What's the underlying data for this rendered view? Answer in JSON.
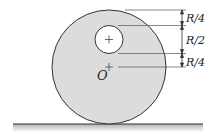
{
  "diagram": {
    "center_label": "O",
    "dimensions": [
      {
        "label": "R/4",
        "from": "top of disk",
        "to": "top of hole"
      },
      {
        "label": "R/2",
        "from": "top of hole",
        "to": "bottom of hole"
      },
      {
        "label": "R/4",
        "from": "bottom of hole",
        "to": "center O"
      }
    ],
    "colors": {
      "disk_fill": "#dcdcdc",
      "hole_fill": "#ffffff",
      "stroke": "#333333",
      "ground_shadow": "#bdbdbd"
    }
  }
}
